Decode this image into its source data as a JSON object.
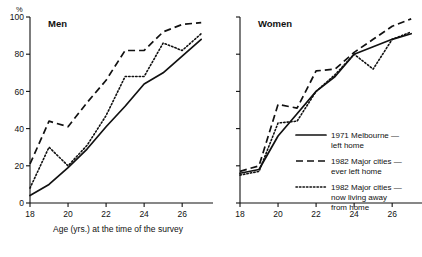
{
  "figure": {
    "y_unit_label": "%",
    "x_axis_title": "Age (yrs.) at the time of the survey"
  },
  "panels": [
    {
      "title": "Men"
    },
    {
      "title": "Women"
    }
  ],
  "legend": {
    "entries": [
      {
        "key": "solid",
        "label_line1": "1971  Melbourne —",
        "label_line2": "left home",
        "label_line3": ""
      },
      {
        "key": "dashed",
        "label_line1": "1982  Major cities —",
        "label_line2": "ever left home",
        "label_line3": ""
      },
      {
        "key": "dotted",
        "label_line1": "1982  Major cities —",
        "label_line2": "now living away",
        "label_line3": "from home"
      }
    ]
  },
  "axes": {
    "y_ticks": [
      "0",
      "20",
      "40",
      "60",
      "80",
      "100"
    ],
    "y_values": [
      0,
      20,
      40,
      60,
      80,
      100
    ],
    "x_ticks": [
      "18",
      "20",
      "22",
      "24",
      "26"
    ],
    "x_values": [
      18,
      20,
      22,
      24,
      26
    ],
    "xlim": [
      18,
      27.2
    ],
    "ylim": [
      0,
      100
    ]
  },
  "chart_data": {
    "type": "line",
    "xlabel": "Age (yrs.) at the time of the survey",
    "ylabel": "%",
    "xlim": [
      18,
      27.2
    ],
    "ylim": [
      0,
      100
    ],
    "grid": false,
    "legend_position": "inside lower-right of Women panel",
    "panels": [
      {
        "name": "Men",
        "x": [
          18,
          19,
          20,
          21,
          22,
          23,
          24,
          25,
          26,
          27
        ],
        "series": [
          {
            "name": "1971 Melbourne — left home",
            "style": "solid",
            "values": [
              4,
              10,
              19,
              29,
              41,
              52,
              64,
              70,
              79,
              88
            ]
          },
          {
            "name": "1982 Major cities — ever left home",
            "style": "dashed",
            "values": [
              21,
              44,
              41,
              54,
              66,
              82,
              82,
              92,
              96,
              97
            ]
          },
          {
            "name": "1982 Major cities — now living away from home",
            "style": "dotted",
            "values": [
              8,
              30,
              20,
              31,
              47,
              68,
              68,
              86,
              82,
              91
            ]
          }
        ]
      },
      {
        "name": "Women",
        "x": [
          18,
          19,
          20,
          21,
          22,
          23,
          24,
          25,
          26,
          27
        ],
        "series": [
          {
            "name": "1971 Melbourne — left home",
            "style": "solid",
            "values": [
              16,
              18,
              36,
              48,
              60,
              68,
              80,
              84,
              88,
              91
            ]
          },
          {
            "name": "1982 Major cities — ever left home",
            "style": "dashed",
            "values": [
              17,
              20,
              53,
              51,
              71,
              72,
              81,
              88,
              95,
              99
            ]
          },
          {
            "name": "1982 Major cities — now living away from home",
            "style": "dotted",
            "values": [
              15,
              17,
              43,
              44,
              60,
              69,
              80,
              72,
              88,
              92
            ]
          }
        ]
      }
    ]
  }
}
